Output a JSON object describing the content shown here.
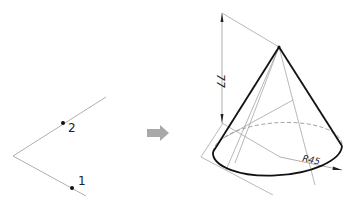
{
  "caption": "",
  "left_figure": {
    "points": [
      {
        "label": "2",
        "x": 63,
        "y": 123
      },
      {
        "label": "1",
        "x": 72,
        "y": 188
      }
    ]
  },
  "arrow": {
    "color": "#a9a9a9"
  },
  "right_figure": {
    "height_dimension": "77",
    "radius_dimension": "R45"
  }
}
